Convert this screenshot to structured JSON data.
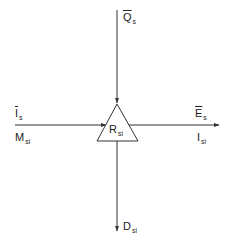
{
  "diagram": {
    "type": "flow-node",
    "node": {
      "shape": "triangle",
      "label": {
        "main": "R",
        "sub": "si"
      }
    },
    "flows": [
      {
        "id": "top-input",
        "direction": "in",
        "from": "top",
        "labels": [
          {
            "main": "Q",
            "sub": "s",
            "overbar": true
          }
        ]
      },
      {
        "id": "left-input",
        "direction": "in",
        "from": "left",
        "labels": [
          {
            "main": "I",
            "sub": "s",
            "overbar": true
          },
          {
            "main": "M",
            "sub": "si",
            "overbar": false
          }
        ]
      },
      {
        "id": "right-output",
        "direction": "out",
        "to": "right",
        "labels": [
          {
            "main": "E",
            "sub": "s",
            "overbar": true
          },
          {
            "main": "I",
            "sub": "si",
            "overbar": false
          }
        ]
      },
      {
        "id": "bottom-output",
        "direction": "out",
        "to": "bottom",
        "labels": [
          {
            "main": "D",
            "sub": "si",
            "overbar": false
          }
        ]
      }
    ],
    "colors": {
      "line": "#333333",
      "background": "#ffffff"
    }
  }
}
